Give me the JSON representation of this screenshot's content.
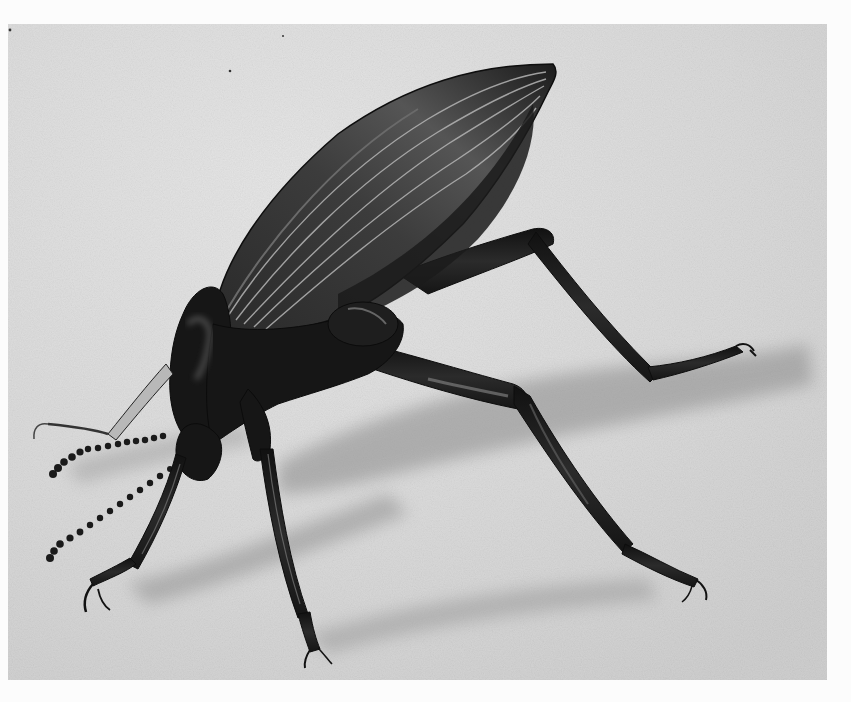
{
  "image": {
    "subject": "beetle",
    "description": "Black-and-white photograph of a dark ground beetle in a headstand posture on a pale textured surface",
    "style": "monochrome photograph",
    "colors": {
      "border": "#fcfcfc",
      "background": "#d9d9d9",
      "background_light": "#e4e4e4",
      "shadow": "#9a9a9a",
      "body": "#1a1a1a",
      "body_highlight": "#6a6a6a",
      "ridge_highlight": "#b5b5b5"
    }
  }
}
